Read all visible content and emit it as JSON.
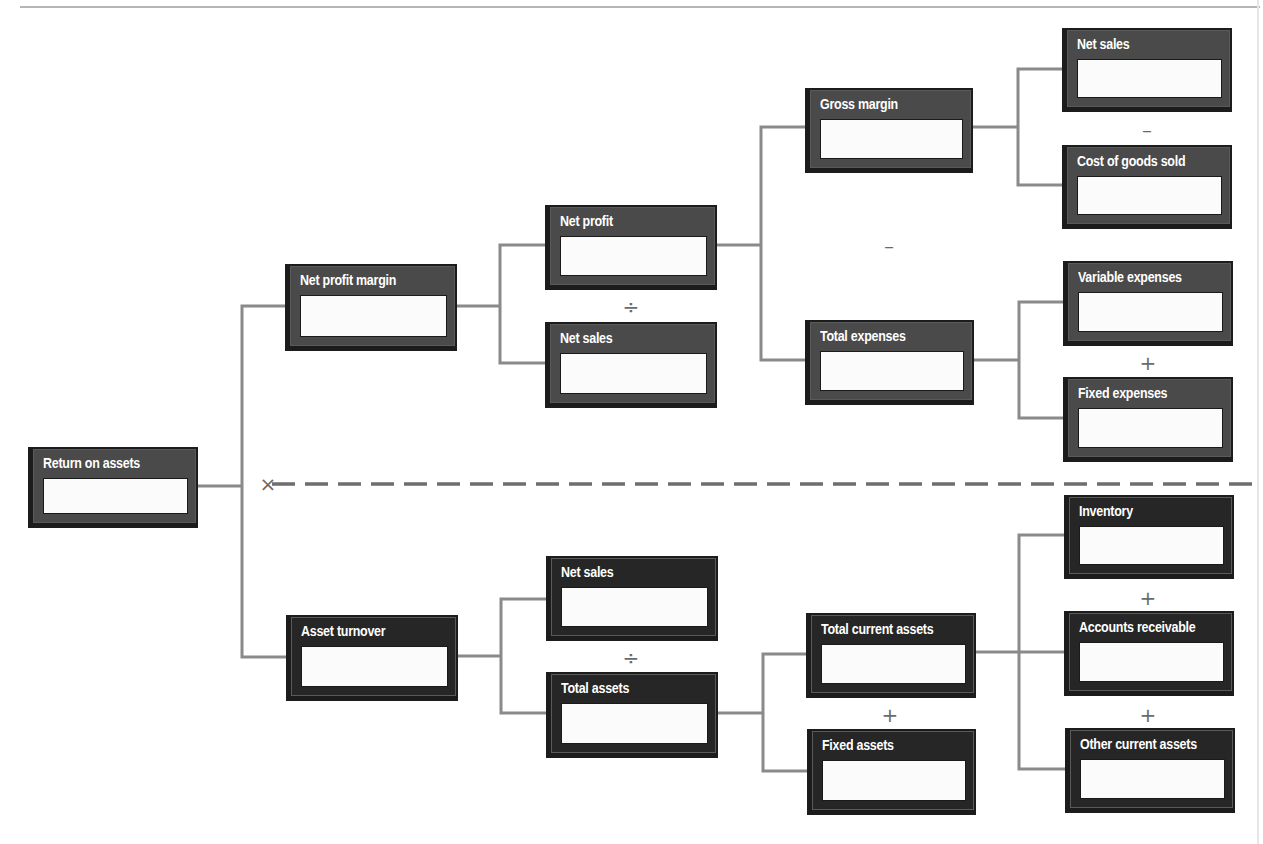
{
  "diagram": {
    "colors": {
      "box_fill": "#4a4a4a",
      "box_fill_dark": "#262626",
      "box_border": "#1c1c1c",
      "value_field": "#fbfbfb",
      "connector": "#8a8a8a",
      "divider": "#6e6e6e",
      "operator": "#6a6a6a"
    },
    "nodes": [
      {
        "id": "roa",
        "label": "Return on assets",
        "value": ""
      },
      {
        "id": "npm",
        "label": "Net profit margin",
        "value": ""
      },
      {
        "id": "at",
        "label": "Asset turnover",
        "value": ""
      },
      {
        "id": "np",
        "label": "Net profit",
        "value": ""
      },
      {
        "id": "ns1",
        "label": "Net sales",
        "value": ""
      },
      {
        "id": "ns2",
        "label": "Net sales",
        "value": ""
      },
      {
        "id": "ta",
        "label": "Total assets",
        "value": ""
      },
      {
        "id": "gm",
        "label": "Gross margin",
        "value": ""
      },
      {
        "id": "te",
        "label": "Total expenses",
        "value": ""
      },
      {
        "id": "tca",
        "label": "Total current assets",
        "value": ""
      },
      {
        "id": "fa",
        "label": "Fixed assets",
        "value": ""
      },
      {
        "id": "ns3",
        "label": "Net sales",
        "value": ""
      },
      {
        "id": "cogs",
        "label": "Cost of goods sold",
        "value": ""
      },
      {
        "id": "ve",
        "label": "Variable expenses",
        "value": ""
      },
      {
        "id": "fe",
        "label": "Fixed expenses",
        "value": ""
      },
      {
        "id": "inv",
        "label": "Inventory",
        "value": ""
      },
      {
        "id": "ar",
        "label": "Accounts receivable",
        "value": ""
      },
      {
        "id": "oca",
        "label": "Other current assets",
        "value": ""
      }
    ],
    "operators": {
      "roa_multiply": "×",
      "npm_divide": "÷",
      "np_minus": "–",
      "gm_minus": "–",
      "te_plus": "+",
      "at_divide": "÷",
      "ta_plus": "+",
      "tca_plus_1": "+",
      "tca_plus_2": "+"
    },
    "edges": [
      [
        "roa",
        "npm"
      ],
      [
        "roa",
        "at"
      ],
      [
        "npm",
        "np"
      ],
      [
        "npm",
        "ns1"
      ],
      [
        "np",
        "gm"
      ],
      [
        "np",
        "te"
      ],
      [
        "gm",
        "ns3"
      ],
      [
        "gm",
        "cogs"
      ],
      [
        "te",
        "ve"
      ],
      [
        "te",
        "fe"
      ],
      [
        "at",
        "ns2"
      ],
      [
        "at",
        "ta"
      ],
      [
        "ta",
        "tca"
      ],
      [
        "ta",
        "fa"
      ],
      [
        "tca",
        "inv"
      ],
      [
        "tca",
        "ar"
      ],
      [
        "tca",
        "oca"
      ]
    ]
  }
}
